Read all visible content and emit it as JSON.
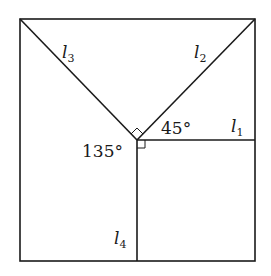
{
  "diagram": {
    "type": "geometry",
    "lines": [
      {
        "id": "l1",
        "label": "l",
        "subscript": "1",
        "orientation": "horizontal, from center to right edge"
      },
      {
        "id": "l2",
        "label": "l",
        "subscript": "2",
        "orientation": "diagonal, center to top-right corner"
      },
      {
        "id": "l3",
        "label": "l",
        "subscript": "3",
        "orientation": "diagonal, center to top-left corner"
      },
      {
        "id": "l4",
        "label": "l",
        "subscript": "4",
        "orientation": "vertical, center to bottom edge"
      }
    ],
    "angles": [
      {
        "label": "45°",
        "between": "l1 and l2"
      },
      {
        "label": "135°",
        "between": "l3 and l4"
      },
      {
        "label": "right angle",
        "between": "l2 and l3"
      },
      {
        "label": "right angle",
        "between": "l1 and l4"
      }
    ]
  },
  "labels": {
    "l1_main": "l",
    "l1_sub": "1",
    "l2_main": "l",
    "l2_sub": "2",
    "l3_main": "l",
    "l3_sub": "3",
    "l4_main": "l",
    "l4_sub": "4",
    "angle_45": "45°",
    "angle_135": "135°"
  }
}
